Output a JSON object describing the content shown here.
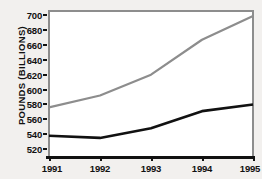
{
  "chart_data": {
    "type": "line",
    "title": "",
    "xlabel": "",
    "ylabel": "POUNDS (BILLIONS)",
    "x": [
      "1991",
      "1992",
      "1993",
      "1994",
      "1995"
    ],
    "categories": [
      "1991",
      "1992",
      "1993",
      "1994",
      "1995"
    ],
    "xlim": [
      1991,
      1995
    ],
    "ylim": [
      508,
      707
    ],
    "yticks": [
      520,
      540,
      560,
      580,
      600,
      620,
      640,
      660,
      680,
      700
    ],
    "ytick_labels": [
      "520",
      "540",
      "560",
      "580",
      "600",
      "620",
      "640",
      "660",
      "680",
      "700"
    ],
    "xticks": [
      1991,
      1992,
      1993,
      1994,
      1995
    ],
    "xtick_labels": [
      "1991",
      "1992",
      "1993",
      "1994",
      "1995"
    ],
    "grid": false,
    "legend": "none",
    "series": [
      {
        "name": "upper-gray-series",
        "color": "#8d8d8d",
        "width": 2.2,
        "values": [
          576,
          592,
          620,
          667,
          699
        ]
      },
      {
        "name": "lower-black-series",
        "color": "#111111",
        "width": 2.6,
        "values": [
          538,
          535,
          548,
          571,
          580
        ]
      }
    ],
    "colors": {
      "background": "#f2f0ee",
      "plot_background": "#ffffff",
      "frame": "#8d8d8d",
      "axis": "#111111",
      "text": "#111111"
    }
  }
}
